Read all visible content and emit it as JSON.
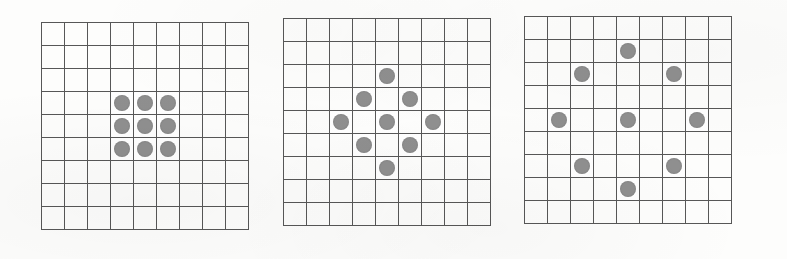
{
  "figure": {
    "background_color": "#fdfdfc",
    "grid_line_color": "#575757",
    "dot_color": "#8f8f8f",
    "rows": 9,
    "cols": 9,
    "cell_size_px": 23,
    "dot_diameter_px": 16
  },
  "chart_data": {
    "type": "heatmap",
    "xlabel": "",
    "ylabel": "",
    "grid": true,
    "legend": "none",
    "rows": 9,
    "cols": 9,
    "categories": [
      "panel-1",
      "panel-2",
      "panel-3"
    ],
    "values": [
      9,
      9,
      9
    ],
    "series": [
      {
        "name": "panel-1",
        "label": "3x3 solid block",
        "marked_count": 9,
        "marked_cells": [
          [
            4,
            4
          ],
          [
            4,
            5
          ],
          [
            4,
            6
          ],
          [
            5,
            4
          ],
          [
            5,
            5
          ],
          [
            5,
            6
          ],
          [
            6,
            4
          ],
          [
            6,
            5
          ],
          [
            6,
            6
          ]
        ],
        "matrix": [
          [
            0,
            0,
            0,
            0,
            0,
            0,
            0,
            0,
            0
          ],
          [
            0,
            0,
            0,
            0,
            0,
            0,
            0,
            0,
            0
          ],
          [
            0,
            0,
            0,
            0,
            0,
            0,
            0,
            0,
            0
          ],
          [
            0,
            0,
            0,
            1,
            1,
            1,
            0,
            0,
            0
          ],
          [
            0,
            0,
            0,
            1,
            1,
            1,
            0,
            0,
            0
          ],
          [
            0,
            0,
            0,
            1,
            1,
            1,
            0,
            0,
            0
          ],
          [
            0,
            0,
            0,
            0,
            0,
            0,
            0,
            0,
            0
          ],
          [
            0,
            0,
            0,
            0,
            0,
            0,
            0,
            0,
            0
          ],
          [
            0,
            0,
            0,
            0,
            0,
            0,
            0,
            0,
            0
          ]
        ]
      },
      {
        "name": "panel-2",
        "label": "diamond of radius 2",
        "marked_count": 9,
        "marked_cells": [
          [
            3,
            5
          ],
          [
            4,
            4
          ],
          [
            4,
            6
          ],
          [
            5,
            3
          ],
          [
            5,
            5
          ],
          [
            5,
            7
          ],
          [
            6,
            4
          ],
          [
            6,
            6
          ],
          [
            7,
            5
          ]
        ],
        "matrix": [
          [
            0,
            0,
            0,
            0,
            0,
            0,
            0,
            0,
            0
          ],
          [
            0,
            0,
            0,
            0,
            0,
            0,
            0,
            0,
            0
          ],
          [
            0,
            0,
            0,
            0,
            1,
            0,
            0,
            0,
            0
          ],
          [
            0,
            0,
            0,
            1,
            0,
            1,
            0,
            0,
            0
          ],
          [
            0,
            0,
            1,
            0,
            1,
            0,
            1,
            0,
            0
          ],
          [
            0,
            0,
            0,
            1,
            0,
            1,
            0,
            0,
            0
          ],
          [
            0,
            0,
            0,
            0,
            1,
            0,
            0,
            0,
            0
          ],
          [
            0,
            0,
            0,
            0,
            0,
            0,
            0,
            0,
            0
          ],
          [
            0,
            0,
            0,
            0,
            0,
            0,
            0,
            0,
            0
          ]
        ]
      },
      {
        "name": "panel-3",
        "label": "diamond of radius 3",
        "marked_count": 9,
        "marked_cells": [
          [
            2,
            5
          ],
          [
            3,
            3
          ],
          [
            3,
            7
          ],
          [
            5,
            2
          ],
          [
            5,
            5
          ],
          [
            5,
            8
          ],
          [
            7,
            3
          ],
          [
            7,
            7
          ],
          [
            8,
            5
          ]
        ],
        "matrix": [
          [
            0,
            0,
            0,
            0,
            0,
            0,
            0,
            0,
            0
          ],
          [
            0,
            0,
            0,
            0,
            1,
            0,
            0,
            0,
            0
          ],
          [
            0,
            0,
            1,
            0,
            0,
            0,
            1,
            0,
            0
          ],
          [
            0,
            0,
            0,
            0,
            0,
            0,
            0,
            0,
            0
          ],
          [
            0,
            1,
            0,
            0,
            1,
            0,
            0,
            1,
            0
          ],
          [
            0,
            0,
            0,
            0,
            0,
            0,
            0,
            0,
            0
          ],
          [
            0,
            0,
            1,
            0,
            0,
            0,
            1,
            0,
            0
          ],
          [
            0,
            0,
            0,
            0,
            1,
            0,
            0,
            0,
            0
          ],
          [
            0,
            0,
            0,
            0,
            0,
            0,
            0,
            0,
            0
          ]
        ]
      }
    ]
  },
  "panels": [
    {
      "name": "panel-1",
      "left_px": 41,
      "top_px": 22
    },
    {
      "name": "panel-2",
      "left_px": 283,
      "top_px": 18
    },
    {
      "name": "panel-3",
      "left_px": 524,
      "top_px": 16
    }
  ]
}
